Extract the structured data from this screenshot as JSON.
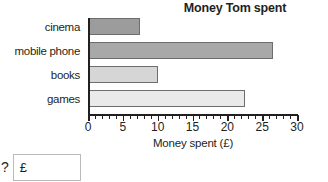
{
  "chart_data": {
    "type": "bar",
    "orientation": "horizontal",
    "title": "Money Tom spent",
    "xlabel": "Money spent (£)",
    "ylabel": "",
    "categories": [
      "cinema",
      "mobile phone",
      "books",
      "games"
    ],
    "values": [
      7.5,
      26.5,
      10,
      22.5
    ],
    "xlim": [
      0,
      30
    ],
    "xticks": [
      0,
      5,
      10,
      15,
      20,
      25,
      30
    ],
    "xtick_labels": [
      "0",
      "5",
      "10",
      "15",
      "20",
      "25",
      "30"
    ],
    "minor_tick_interval": 1,
    "grid": false,
    "legend": false,
    "bar_colors": [
      "#9c9c9c",
      "#a8a8a8",
      "#d6d6d6",
      "#eaeaea"
    ],
    "bar_edge_color": "#6d6d6d"
  },
  "answer": {
    "prompt": "?",
    "currency_symbol": "£",
    "value": "",
    "placeholder": ""
  }
}
